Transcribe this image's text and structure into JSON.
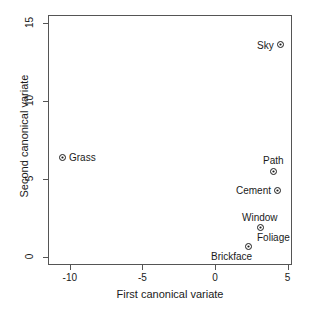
{
  "chart_data": {
    "type": "scatter",
    "title": "",
    "xlabel": "First canonical variate",
    "ylabel": "Second canonical variate",
    "xlim": [
      -11.5,
      5.3
    ],
    "ylim": [
      -0.5,
      15.5
    ],
    "xticks": [
      -10,
      -5,
      0,
      5
    ],
    "xticklabels": [
      "-10",
      "-5",
      "0",
      "5"
    ],
    "yticks": [
      0,
      5,
      10,
      15
    ],
    "yticklabels": [
      "0",
      "5",
      "10",
      "15"
    ],
    "grid": false,
    "legend": null,
    "marker": "circle-with-center-dot",
    "points": [
      {
        "label": "Sky",
        "x": 4.5,
        "y": 13.6,
        "label_pos": "left"
      },
      {
        "label": "Path",
        "x": 4.0,
        "y": 5.5,
        "label_pos": "above"
      },
      {
        "label": "Cement",
        "x": 4.3,
        "y": 4.3,
        "label_pos": "left"
      },
      {
        "label": "Window",
        "x": 3.1,
        "y": 1.9,
        "label_pos": "above"
      },
      {
        "label": "Foliage",
        "x": 3.1,
        "y": 1.9,
        "label_pos": "below-right"
      },
      {
        "label": "Brickface",
        "x": 2.3,
        "y": 0.7,
        "label_pos": "below-left"
      },
      {
        "label": "Grass",
        "x": -10.5,
        "y": 6.4,
        "label_pos": "right"
      }
    ]
  },
  "colors": {
    "background": "#ffffff",
    "frame": "#555555",
    "text": "#1a1a1a",
    "marker": "#1a1a1a"
  }
}
